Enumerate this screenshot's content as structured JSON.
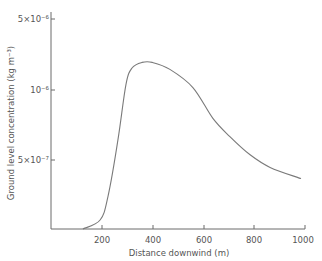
{
  "chart_data": {
    "type": "line",
    "title": "",
    "xlabel": "Distance downwind (m)",
    "ylabel": "Ground level concentration (kg m⁻³)",
    "xlim": [
      0,
      1000
    ],
    "ylim": [
      0,
      1.5e-06
    ],
    "grid": false,
    "legend": null,
    "x_ticks": [
      200,
      400,
      600,
      800,
      1000
    ],
    "x_tick_labels": [
      "200",
      "400",
      "600",
      "800",
      "1000"
    ],
    "y_ticks": [
      5e-07,
      1e-06,
      1.5e-06
    ],
    "y_tick_labels": [
      "5×10⁻⁷",
      "10⁻⁶",
      "5×10⁻⁶"
    ],
    "series": [
      {
        "name": "Ground level concentration",
        "x": [
          126,
          194,
          225,
          265,
          296,
          320,
          360,
          400,
          470,
          561,
          640,
          707,
          787,
          866,
          988
        ],
        "values": [
          0,
          6.4e-08,
          2.3e-07,
          6.4e-07,
          1.03e-06,
          1.15e-06,
          1.19e-06,
          1.19e-06,
          1.14e-06,
          1.01e-06,
          7.9e-07,
          6.6e-07,
          5.3e-07,
          4.4e-07,
          3.6e-07
        ]
      }
    ]
  },
  "axes": {
    "x_title": "Distance downwind (m)",
    "y_title": "Ground level concentration (kg m⁻³)",
    "x_labels": [
      "200",
      "400",
      "600",
      "800",
      "1000"
    ],
    "y_labels": [
      "5×10⁻⁷",
      "10⁻⁶",
      "5×10⁻⁶"
    ]
  },
  "colors": {
    "line": "#7a7a7a",
    "axis": "#6a6a6a",
    "text": "#555555"
  }
}
